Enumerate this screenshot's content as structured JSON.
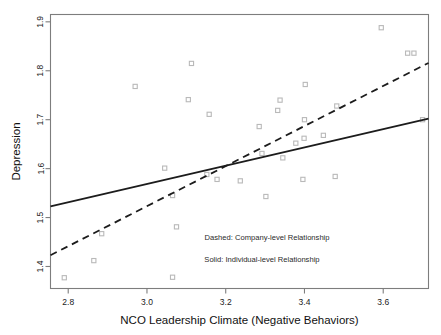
{
  "chart_data": {
    "type": "scatter",
    "title": "",
    "xlabel": "NCO Leadership Climate (Negative Behaviors)",
    "ylabel": "Depression",
    "xlim": [
      2.755,
      3.715
    ],
    "ylim": [
      1.355,
      1.915
    ],
    "xticks": [
      2.8,
      3.0,
      3.2,
      3.4,
      3.6
    ],
    "xtick_labels": [
      "2.8",
      "3.0",
      "3.2",
      "3.4",
      "3.6"
    ],
    "yticks": [
      1.4,
      1.5,
      1.6,
      1.7,
      1.8,
      1.9
    ],
    "ytick_labels": [
      "1.4",
      "1.5",
      "1.6",
      "1.7",
      "1.8",
      "1.9"
    ],
    "grid": false,
    "marker_style": "open-square",
    "marker_color": "#b9b9b9",
    "points": [
      [
        2.79,
        1.377
      ],
      [
        2.865,
        1.412
      ],
      [
        2.885,
        1.467
      ],
      [
        2.97,
        1.768
      ],
      [
        3.045,
        1.601
      ],
      [
        3.065,
        1.545
      ],
      [
        3.065,
        1.378
      ],
      [
        3.075,
        1.481
      ],
      [
        3.105,
        1.741
      ],
      [
        3.113,
        1.815
      ],
      [
        3.152,
        1.588
      ],
      [
        3.158,
        1.711
      ],
      [
        3.178,
        1.578
      ],
      [
        3.237,
        1.575
      ],
      [
        3.285,
        1.686
      ],
      [
        3.292,
        1.631
      ],
      [
        3.302,
        1.543
      ],
      [
        3.332,
        1.719
      ],
      [
        3.338,
        1.74
      ],
      [
        3.345,
        1.622
      ],
      [
        3.378,
        1.652
      ],
      [
        3.396,
        1.578
      ],
      [
        3.399,
        1.662
      ],
      [
        3.4,
        1.7
      ],
      [
        3.402,
        1.772
      ],
      [
        3.448,
        1.668
      ],
      [
        3.478,
        1.584
      ],
      [
        3.482,
        1.728
      ],
      [
        3.595,
        1.888
      ],
      [
        3.662,
        1.836
      ],
      [
        3.678,
        1.836
      ],
      [
        3.7,
        1.7
      ]
    ],
    "series": [
      {
        "name": "Company-level Relationship",
        "style": "dashed",
        "color": "#1c1c1c",
        "line_x": [
          2.755,
          3.715
        ],
        "line_y": [
          1.423,
          1.816
        ]
      },
      {
        "name": "Individual-level Relationship",
        "style": "solid",
        "color": "#1c1c1c",
        "line_x": [
          2.755,
          3.715
        ],
        "line_y": [
          1.523,
          1.702
        ]
      }
    ],
    "annotations": [
      {
        "name": "dashed-legend",
        "text": "Dashed: Company-level Relationship",
        "x": 3.305,
        "y": 1.455
      },
      {
        "name": "solid-legend",
        "text": "Solid: Individual-level Relationship",
        "x": 3.292,
        "y": 1.41
      }
    ]
  },
  "axes": {
    "x_title": "NCO Leadership Climate (Negative Behaviors)",
    "y_title": "Depression"
  },
  "legend": {
    "dashed_label": "Dashed: Company-level Relationship",
    "solid_label": "Solid: Individual-level Relationship"
  }
}
